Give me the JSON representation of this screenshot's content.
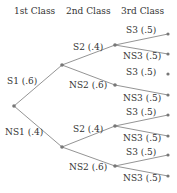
{
  "headers": [
    "1st Class",
    "2nd Class",
    "3rd Class"
  ],
  "branches": {
    "s1": "S1 (.6)",
    "ns1": "NS1 (.4)",
    "s1_s2": "S2 (.4)",
    "s1_ns2": "NS2 (.6)",
    "ns1_s2": "S2 (.4)",
    "ns1_ns2": "NS2 (.6)",
    "s3_1": "S3 (.5)",
    "ns3_1": "NS3 (.5)",
    "s3_2": "S3 (.5)",
    "ns3_2": "NS3 (.5)",
    "s3_3": "S3 (.5)",
    "ns3_3": "NS3 (.5)",
    "s3_4": "S3 (.5)",
    "ns3_4": "NS3 (.5)"
  },
  "colors": {
    "line": "#777777",
    "node": "#777777",
    "text": "#333333"
  }
}
